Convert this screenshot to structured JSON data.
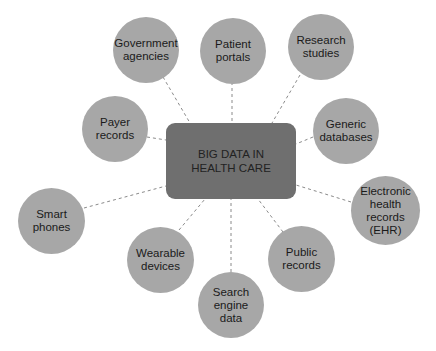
{
  "diagram": {
    "hub": {
      "label": "BIG DATA IN\nHEALTH CARE",
      "color": "#6f6f6f"
    },
    "node_color": "#a7a7a7",
    "link_color": "#8a8a8a",
    "nodes": [
      {
        "id": "government-agencies",
        "label": "Government\nagencies"
      },
      {
        "id": "patient-portals",
        "label": "Patient\nportals"
      },
      {
        "id": "research-studies",
        "label": "Research\nstudies"
      },
      {
        "id": "payer-records",
        "label": "Payer\nrecords"
      },
      {
        "id": "generic-databases",
        "label": "Generic\ndatabases"
      },
      {
        "id": "electronic-health-records",
        "label": "Electronic\nhealth\nrecords\n(EHR)"
      },
      {
        "id": "smart-phones",
        "label": "Smart\nphones"
      },
      {
        "id": "wearable-devices",
        "label": "Wearable\ndevices"
      },
      {
        "id": "public-records",
        "label": "Public\nrecords"
      },
      {
        "id": "search-engine-data",
        "label": "Search\nengine\ndata"
      }
    ]
  }
}
